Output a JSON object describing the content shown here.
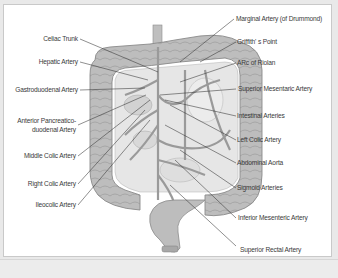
{
  "diagram": {
    "left_labels": [
      {
        "id": "celiac-trunk",
        "text": "Celiac Trunk"
      },
      {
        "id": "hepatic-artery",
        "text": "Hepatic Artery"
      },
      {
        "id": "gastroduodenal-artery",
        "text": "Gastroduodenal Artery"
      },
      {
        "id": "anterior-pancreatico-duodenal-artery-1",
        "text": "Anterior Pancreatico-"
      },
      {
        "id": "anterior-pancreatico-duodenal-artery-2",
        "text": "duodenal Artery"
      },
      {
        "id": "middle-colic-artery",
        "text": "Middle Colic Artery"
      },
      {
        "id": "right-colic-artery",
        "text": "Right Colic Artery"
      },
      {
        "id": "ileocolic-artery",
        "text": "Ileocolic Artery"
      }
    ],
    "right_labels": [
      {
        "id": "marginal-artery",
        "text": "Marginal Artery (of Drummond)"
      },
      {
        "id": "griffiths-point",
        "text": "Griffith' s Point"
      },
      {
        "id": "arc-of-riolan",
        "text": "ARc of Riolan"
      },
      {
        "id": "superior-mesenteric-artery",
        "text": "Superior Mesentaric Artery"
      },
      {
        "id": "intestinal-arteries",
        "text": "Intestinal Arteries"
      },
      {
        "id": "left-colic-artery",
        "text": "Left Colic Artery"
      },
      {
        "id": "abdominal-aorta",
        "text": "Abdominal Aorta"
      },
      {
        "id": "sigmoid-arteries",
        "text": "Sigmoid Arteries"
      },
      {
        "id": "inferior-mesenteric-artery",
        "text": "Inferior Mesenteric Artery"
      },
      {
        "id": "superior-rectal-artery",
        "text": "Superior Rectal Artery"
      }
    ],
    "colors": {
      "colon_fill": "#b9b9b9",
      "colon_stroke": "#8a8a8a",
      "vessel": "#9a9a9a",
      "leader_line": "#333333",
      "label_text": "#3a3a3a"
    }
  }
}
